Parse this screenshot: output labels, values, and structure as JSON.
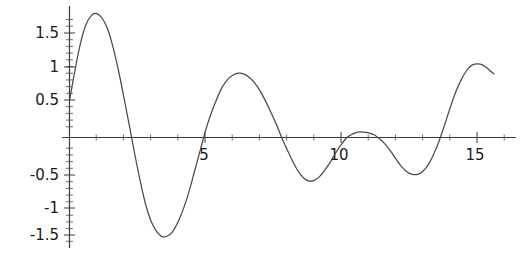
{
  "chart_data": {
    "type": "line",
    "title": "",
    "subtitle": "",
    "xlabel": "",
    "ylabel": "",
    "xlim": [
      0,
      15.8
    ],
    "ylim": [
      -1.75,
      2.0
    ],
    "grid": false,
    "legend": null,
    "x_ticks": [
      5,
      10,
      15
    ],
    "x_tick_labels": [
      "5",
      "10",
      "15"
    ],
    "x_minor_tick_step": 1,
    "y_ticks": [
      -1.5,
      -1,
      -0.5,
      0.5,
      1,
      1.5
    ],
    "y_tick_labels": [
      "-1.5",
      "-1",
      "-0.5",
      "0.5",
      "1",
      "1.5"
    ],
    "y_minor_tick_step": 0.1,
    "series": [
      {
        "name": "damped oscillation",
        "color": "#4a4a4a",
        "x": [
          0.0,
          0.2,
          0.4,
          0.6,
          0.8,
          1.0,
          1.2,
          1.4,
          1.6,
          1.8,
          2.0,
          2.2,
          2.4,
          2.6,
          2.8,
          3.0,
          3.2,
          3.4,
          3.6,
          3.8,
          4.0,
          4.2,
          4.4,
          4.6,
          4.8,
          5.0,
          5.2,
          5.4,
          5.6,
          5.8,
          6.0,
          6.2,
          6.4,
          6.6,
          6.8,
          7.0,
          7.2,
          7.4,
          7.6,
          7.8,
          8.0,
          8.2,
          8.4,
          8.6,
          8.8,
          9.0,
          9.2,
          9.4,
          9.6,
          9.8,
          10.0,
          10.2,
          10.4,
          10.6,
          10.8,
          11.0,
          11.2,
          11.4,
          11.6,
          11.8,
          12.0,
          12.2,
          12.4,
          12.6,
          12.8,
          13.0,
          13.2,
          13.4,
          13.6,
          13.8,
          14.0,
          14.2,
          14.4,
          14.6,
          14.8,
          15.0,
          15.2,
          15.4,
          15.6
        ],
        "y": [
          0.55,
          1.0,
          1.4,
          1.68,
          1.82,
          1.85,
          1.78,
          1.62,
          1.35,
          1.0,
          0.6,
          0.18,
          -0.25,
          -0.65,
          -1.0,
          -1.25,
          -1.4,
          -1.48,
          -1.47,
          -1.4,
          -1.25,
          -1.05,
          -0.8,
          -0.5,
          -0.2,
          0.1,
          0.35,
          0.56,
          0.74,
          0.86,
          0.93,
          0.96,
          0.95,
          0.9,
          0.82,
          0.7,
          0.55,
          0.38,
          0.2,
          0.0,
          -0.18,
          -0.35,
          -0.5,
          -0.6,
          -0.65,
          -0.64,
          -0.58,
          -0.48,
          -0.36,
          -0.22,
          -0.1,
          0.0,
          0.05,
          0.08,
          0.08,
          0.07,
          0.04,
          -0.02,
          -0.1,
          -0.2,
          -0.32,
          -0.43,
          -0.51,
          -0.55,
          -0.55,
          -0.5,
          -0.4,
          -0.24,
          -0.04,
          0.2,
          0.45,
          0.68,
          0.86,
          1.0,
          1.08,
          1.1,
          1.08,
          1.02,
          0.95
        ]
      }
    ]
  },
  "axes": {
    "x_axis_name": "horizontal-axis",
    "y_axis_name": "vertical-axis",
    "axis_color": "#3a3a3a"
  }
}
